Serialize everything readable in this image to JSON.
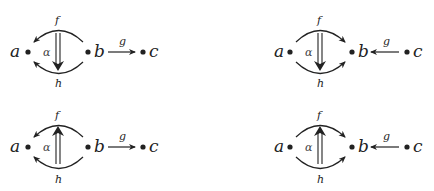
{
  "diagrams": [
    {
      "id": "top-left",
      "objects": {
        "a": "a",
        "b": "b",
        "c": "c"
      },
      "morphisms": {
        "f": "f",
        "h": "h",
        "g": "g"
      },
      "two_cell": "α",
      "direction": "f,h: b→a; g: b→c; α: f⇒h (down)"
    },
    {
      "id": "top-right",
      "objects": {
        "a": "a",
        "b": "b",
        "c": "c"
      },
      "morphisms": {
        "f": "f",
        "h": "h",
        "g": "g"
      },
      "two_cell": "α",
      "direction": "f,h: a→b; g: c→b; α: f⇒h (down)"
    },
    {
      "id": "bottom-left",
      "objects": {
        "a": "a",
        "b": "b",
        "c": "c"
      },
      "morphisms": {
        "f": "f",
        "h": "h",
        "g": "g"
      },
      "two_cell": "α",
      "direction": "f,h: b→a; g: b→c; α: h⇒f (up)"
    },
    {
      "id": "bottom-right",
      "objects": {
        "a": "a",
        "b": "b",
        "c": "c"
      },
      "morphisms": {
        "f": "f",
        "h": "h",
        "g": "g"
      },
      "two_cell": "α",
      "direction": "f,h: a→b; g: c→b; α: h⇒f (up)"
    }
  ],
  "colors": {
    "ink": "#222222",
    "background": "#ffffff"
  }
}
